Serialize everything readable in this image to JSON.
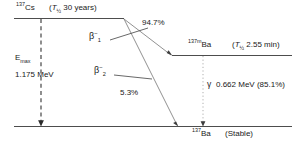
{
  "diagram": {
    "colors": {
      "line": "#4d4d4d",
      "text": "#1a1a1a",
      "dashed": "#2b2b2b",
      "dotted": "#a6a6a6",
      "background": "#ffffff"
    },
    "parent": {
      "nuclide_mass": "137",
      "nuclide_symbol": "Cs",
      "halflife_open": "(",
      "halflife_symbol": "T",
      "halflife_sub": "½",
      "halflife_value": "30 years)"
    },
    "emax": {
      "symbol": "E",
      "subscript": "max",
      "value": "1.175 MeV"
    },
    "branches": [
      {
        "name": "beta-1",
        "symbol": "β",
        "superscript": "−",
        "subscript": "1",
        "intensity": "94.7%"
      },
      {
        "name": "beta-2",
        "symbol": "β",
        "superscript": "−",
        "subscript": "2",
        "intensity": "5.3%"
      }
    ],
    "metastable": {
      "nuclide_mass": "137m",
      "nuclide_symbol": "Ba",
      "halflife_open": "(",
      "halflife_symbol": "T",
      "halflife_sub": "½",
      "halflife_value": "2.55 min)"
    },
    "gamma": {
      "symbol": "γ",
      "text": "0.662 MeV (85.1%)"
    },
    "ground": {
      "nuclide_mass": "137",
      "nuclide_symbol": "Ba",
      "state": "(Stable)"
    }
  }
}
